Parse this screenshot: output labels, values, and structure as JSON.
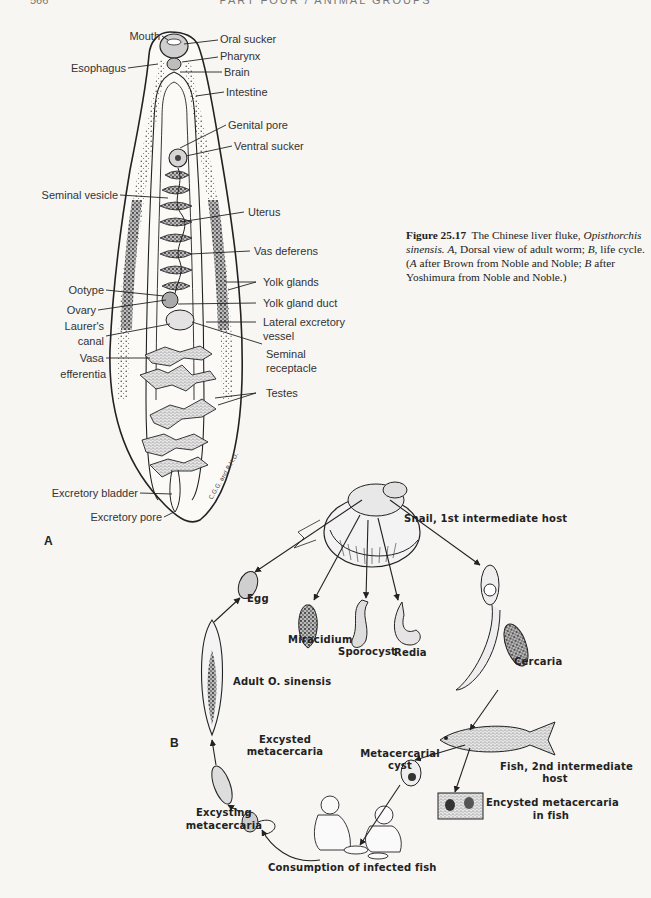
{
  "page": {
    "header": "PART FOUR / ANIMAL GROUPS",
    "page_number": "566"
  },
  "caption": {
    "figure_label": "Figure 25.17",
    "title": "The Chinese liver fluke,",
    "genus": "Opisthorchis",
    "species": "sinensis.",
    "panel_a_letter": "A,",
    "panel_a_text": "Dorsal view of adult worm;",
    "panel_b_letter": "B,",
    "panel_b_text": "life cycle.",
    "credit_open": "(",
    "credit_a_letter": "A",
    "credit_a_text": "after Brown from Noble and Noble;",
    "credit_b_letter": "B",
    "credit_b_text": "after Yoshimura from Noble and Noble.)"
  },
  "panel_a": {
    "letter": "A",
    "signature": "C.G.G. and R.H.D.",
    "labels_left": [
      {
        "text": "Mouth"
      },
      {
        "text": "Esophagus"
      },
      {
        "text": "Seminal vesicle"
      },
      {
        "text": "Ootype"
      },
      {
        "text": "Ovary"
      },
      {
        "text": "Laurer's"
      },
      {
        "text": "canal"
      },
      {
        "text": "Vasa"
      },
      {
        "text": "efferentia"
      },
      {
        "text": "Excretory bladder"
      },
      {
        "text": "Excretory pore"
      }
    ],
    "labels_right": [
      {
        "text": "Oral sucker"
      },
      {
        "text": "Pharynx"
      },
      {
        "text": "Brain"
      },
      {
        "text": "Intestine"
      },
      {
        "text": "Genital pore"
      },
      {
        "text": "Ventral sucker"
      },
      {
        "text": "Uterus"
      },
      {
        "text": "Vas deferens"
      },
      {
        "text": "Yolk glands"
      },
      {
        "text": "Yolk gland duct"
      },
      {
        "text": "Lateral excretory"
      },
      {
        "text": "vessel"
      },
      {
        "text": "Seminal"
      },
      {
        "text": "receptacle"
      },
      {
        "text": "Testes"
      }
    ]
  },
  "panel_b": {
    "letter": "B",
    "stages": {
      "snail": "Snail, 1st intermediate host",
      "egg": "Egg",
      "miracidium": "Miracidium",
      "sporocyst": "Sporocyst",
      "redia": "Redia",
      "cercaria": "Cercaria",
      "adult": "Adult O. sinensis",
      "fish_line1": "Fish, 2nd intermediate",
      "fish_line2": "host",
      "excysted_line1": "Excysted",
      "excysted_line2": "metacercaria",
      "metacercarial_line1": "Metacercarial",
      "metacercarial_line2": "cyst",
      "encysted_line1": "Encysted metacercaria",
      "encysted_line2": "in fish",
      "excysting_line1": "Excysting",
      "excysting_line2": "metacercaria",
      "consumption": "Consumption of infected fish"
    }
  },
  "colors": {
    "paper": "#f7f6f3",
    "ink": "#2a2a2a",
    "label": "#333333"
  }
}
